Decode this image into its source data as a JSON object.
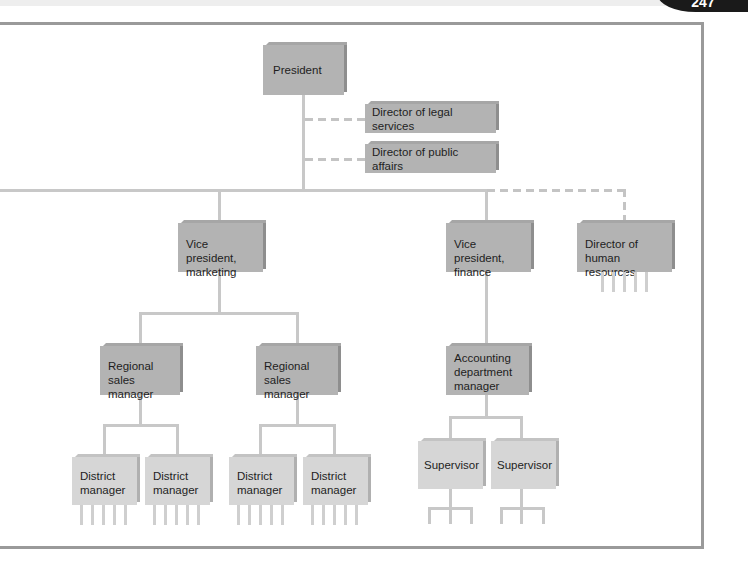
{
  "page": {
    "number": "247"
  },
  "org_chart": {
    "president": "President",
    "staff": [
      {
        "label": "Director of legal services",
        "relationship": "staff (dashed)"
      },
      {
        "label": "Director of public affairs",
        "relationship": "staff (dashed)"
      }
    ],
    "vice_presidents": [
      {
        "label_line1": "Vice president,",
        "label_line2": "marketing",
        "regional": [
          {
            "line1": "Regional",
            "line2": "sales manager",
            "districts": [
              {
                "line1": "District",
                "line2": "manager"
              },
              {
                "line1": "District",
                "line2": "manager"
              }
            ]
          },
          {
            "line1": "Regional",
            "line2": "sales manager",
            "districts": [
              {
                "line1": "District",
                "line2": "manager"
              },
              {
                "line1": "District",
                "line2": "manager"
              }
            ]
          }
        ]
      },
      {
        "label_line1": "Vice president,",
        "label_line2": "finance",
        "accounting": {
          "line1": "Accounting",
          "line2": "department",
          "line3": "manager",
          "supervisors": [
            "Supervisor",
            "Supervisor"
          ]
        }
      }
    ],
    "hr": {
      "line1": "Director of",
      "line2": "human resources",
      "relationship": "staff (dashed)"
    }
  },
  "colors": {
    "box_dark": "#b3b3b3",
    "box_light": "#d6d6d6",
    "line": "#c8c8c8",
    "frame": "#9a9a9a"
  }
}
